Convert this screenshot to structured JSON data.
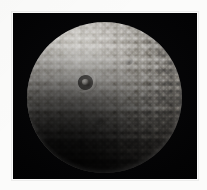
{
  "image": {
    "kind": "astronomical-photograph",
    "subject": "icy moon",
    "caption": "Cratered icy moon with large impact crater, lit from upper left",
    "alt_text": "Grayscale photograph of a heavily cratered spherical icy moon against black space, with one prominent large crater with a central peak in the upper left quadrant",
    "background_label": "space",
    "frame_label": "photo border"
  },
  "colors": {
    "paper": "#fbfbfa",
    "space": "#000000",
    "highlight": "#dcdad6",
    "midtone": "#8a8782",
    "terminator": "#1c1a18",
    "crater_rim": "#ece9e4",
    "crater_floor": "#282623"
  },
  "geometry": {
    "canvas_width": 207,
    "canvas_height": 190,
    "plate_left": 13,
    "plate_top": 13,
    "plate_width": 184,
    "plate_height": 166,
    "moon_center_x": 104,
    "moon_center_y": 97,
    "moon_radius": 76,
    "light_azimuth_label": "upper left",
    "terminator_label": "lower left"
  },
  "features": {
    "main_crater": {
      "name": "large impact crater",
      "center_x": 85,
      "center_y": 72,
      "radius": 11,
      "has_central_peak": true,
      "peak_label": "central peak",
      "rim_label": "crater rim",
      "floor_label": "crater floor",
      "ejecta_label": "ejecta blanket"
    },
    "secondary_craters": [
      {
        "name": "secondary crater north",
        "center_x": 114,
        "center_y": 56,
        "radius": 5
      },
      {
        "name": "secondary crater southwest",
        "center_x": 84,
        "center_y": 114,
        "radius": 6
      },
      {
        "name": "secondary crater east",
        "center_x": 130,
        "center_y": 92,
        "radius": 4
      }
    ],
    "surface_label": "cratered regolith",
    "limb_label": "sunlit limb",
    "shadow_label": "shadowed limb"
  }
}
